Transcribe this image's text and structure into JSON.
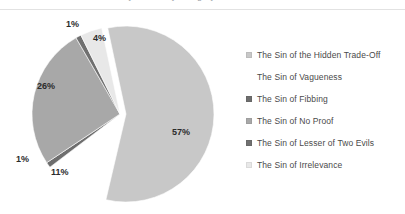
{
  "title": {
    "text": "Survey results by category",
    "clipped": true
  },
  "chart_data": {
    "type": "pie",
    "title": "",
    "exploded_slice": "The Sin of the Hidden Trade-Off",
    "legend_position": "right",
    "categories": [
      "The Sin of the Hidden Trade-Off",
      "The Sin of Vagueness",
      "The Sin of Fibbing",
      "The Sin of No Proof",
      "The Sin of Lesser of Two Evils",
      "The Sin of Irrelevance"
    ],
    "values": [
      57,
      11,
      1,
      26,
      1,
      4
    ],
    "value_labels": [
      "57%",
      "11%",
      "1%",
      "26%",
      "1%",
      "4%"
    ],
    "colors": [
      "#c8c8c8",
      "#ffffff",
      "#6e6e6e",
      "#a8a8a8",
      "#707070",
      "#e8e8e8"
    ],
    "slice_label_positions": [
      {
        "label": "57%",
        "x": 172,
        "y": 118
      },
      {
        "label": "11%",
        "x": 51,
        "y": 158
      },
      {
        "label": "1%",
        "x": 16,
        "y": 145
      },
      {
        "label": "26%",
        "x": 37,
        "y": 72
      },
      {
        "label": "1%",
        "x": 66,
        "y": 10
      },
      {
        "label": "4%",
        "x": 93,
        "y": 24
      }
    ]
  },
  "legend": {
    "items": [
      {
        "label": "The Sin of the Hidden Trade-Off",
        "color": "#c8c8c8",
        "visible_swatch": true
      },
      {
        "label": "The Sin of Vagueness",
        "color": "#ffffff",
        "visible_swatch": false
      },
      {
        "label": "The Sin of Fibbing",
        "color": "#6e6e6e",
        "visible_swatch": true
      },
      {
        "label": "The Sin of No Proof",
        "color": "#a8a8a8",
        "visible_swatch": true
      },
      {
        "label": "The Sin of Lesser of Two Evils",
        "color": "#707070",
        "visible_swatch": true
      },
      {
        "label": "The Sin of Irrelevance",
        "color": "#e8e8e8",
        "visible_swatch": true
      }
    ]
  }
}
